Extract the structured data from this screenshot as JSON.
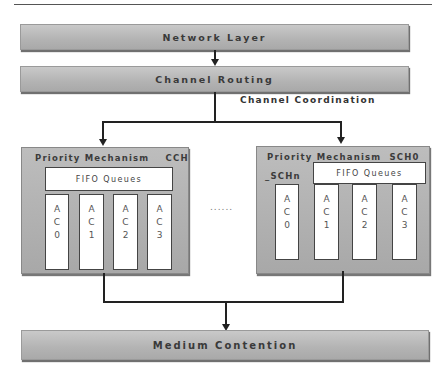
{
  "diagram": {
    "network_layer": "Network Layer",
    "channel_routing": "Channel Routing",
    "channel_coordination": "Channel Coordination",
    "medium_contention": "Medium Contention",
    "ellipsis": "......",
    "cch": {
      "title": "Priority Mechanism",
      "channel": "CCH",
      "fifo": "FIFO Queues",
      "queues": [
        {
          "a": "A",
          "c": "C",
          "n": "0"
        },
        {
          "a": "A",
          "c": "C",
          "n": "1"
        },
        {
          "a": "A",
          "c": "C",
          "n": "2"
        },
        {
          "a": "A",
          "c": "C",
          "n": "3"
        }
      ]
    },
    "sch": {
      "title": "Priority Mechanism",
      "channel": "SCH0",
      "channel_range": "_SCHn",
      "fifo": "FIFO Queues",
      "queues": [
        {
          "a": "A",
          "c": "C",
          "n": "0"
        },
        {
          "a": "A",
          "c": "C",
          "n": "1"
        },
        {
          "a": "A",
          "c": "C",
          "n": "2"
        },
        {
          "a": "A",
          "c": "C",
          "n": "3"
        }
      ]
    }
  }
}
